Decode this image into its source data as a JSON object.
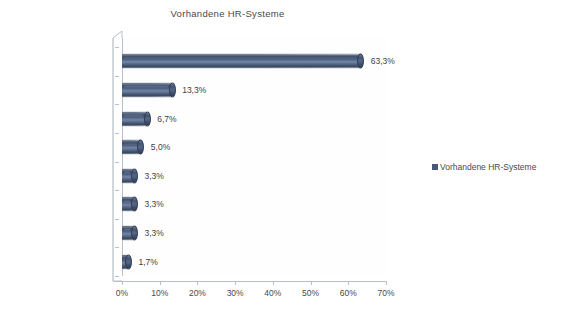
{
  "chart_data": {
    "type": "bar",
    "orientation": "horizontal",
    "title": "Vorhandene HR-Systeme",
    "xlabel": "",
    "ylabel": "",
    "categories": [
      "SAP HCM",
      "PAISY",
      "Eigenentwicklungen",
      "Sonstige",
      "DATEV",
      "LOGA",
      "PeopleSoft",
      "Veda"
    ],
    "values": [
      63.3,
      13.3,
      6.7,
      5.0,
      3.3,
      3.3,
      3.3,
      1.7
    ],
    "value_labels": [
      "63,3%",
      "13,3%",
      "6,7%",
      "5,0%",
      "3,3%",
      "3,3%",
      "3,3%",
      "1,7%"
    ],
    "xlim": [
      0,
      70
    ],
    "xticks": [
      0,
      10,
      20,
      30,
      40,
      50,
      60,
      70
    ],
    "xtick_labels": [
      "0%",
      "10%",
      "20%",
      "30%",
      "40%",
      "50%",
      "60%",
      "70%"
    ],
    "grid": false,
    "legend": {
      "position": "right",
      "entries": [
        {
          "label": "Vorhandene HR-Systeme",
          "color": "#48597a"
        }
      ]
    },
    "series": [
      {
        "name": "Vorhandene HR-Systeme",
        "color": "#48597a",
        "values": [
          63.3,
          13.3,
          6.7,
          5.0,
          3.3,
          3.3,
          3.3,
          1.7
        ]
      }
    ],
    "style": {
      "bar_shape": "cylinder-3d",
      "background": "#ffffff",
      "axis_color": "#b9bfc6",
      "text_color": "#4a4a4a"
    }
  }
}
